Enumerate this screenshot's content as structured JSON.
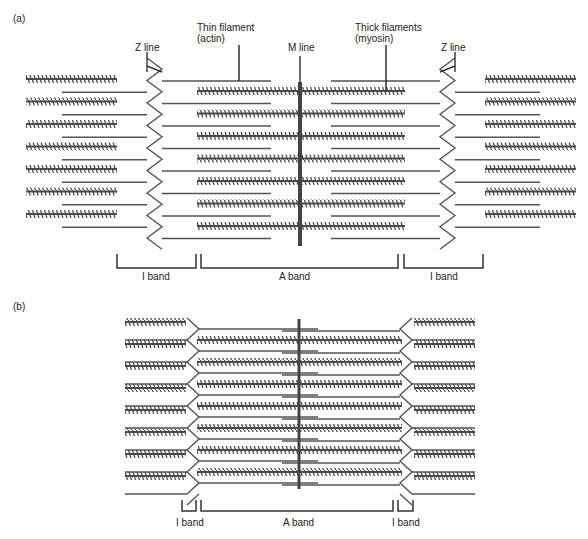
{
  "panels": [
    {
      "id": "a",
      "label": "(a)",
      "state": "relaxed",
      "annotations": {
        "z_line_left": "Z line",
        "thin_filament_line1": "Thin filament",
        "thin_filament_line2": "(actin)",
        "m_line": "M line",
        "thick_filament_line1": "Thick filaments",
        "thick_filament_line2": "(myosin)",
        "z_line_right": "Z line"
      },
      "bands": {
        "i_band_left": "I band",
        "a_band": "A band",
        "i_band_right": "I band"
      }
    },
    {
      "id": "b",
      "label": "(b)",
      "state": "contracted",
      "bands": {
        "i_band_left": "I band",
        "a_band": "A band",
        "i_band_right": "I band"
      }
    }
  ],
  "colors": {
    "filament": "#555555",
    "thick": "#4a4a4a",
    "m_line": "#444444",
    "text": "#222222"
  }
}
